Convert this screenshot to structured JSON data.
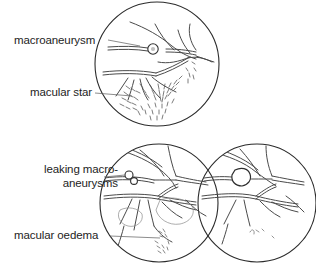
{
  "figure": {
    "background_color": "#ffffff",
    "ink_color": "#3a3a3a",
    "outline_color": "#2b2b2b"
  },
  "labels": [
    {
      "id": "macroaneurysm",
      "text": "macroaneurysm",
      "lines": [
        "macroaneurysm"
      ],
      "points_to": "top-panel-macroaneurysm"
    },
    {
      "id": "macular-star",
      "text": "macular star",
      "lines": [
        "macular star"
      ],
      "points_to": "top-panel-exudate-star"
    },
    {
      "id": "leaking-macroaneurysms",
      "text": "leaking macro-aneurysms",
      "lines": [
        "leaking macro-",
        "aneurysms"
      ],
      "points_to": "bottom-left-panel-aneurysm-cluster"
    },
    {
      "id": "macular-oedema",
      "text": "macular oedema",
      "lines": [
        "macular oedema"
      ],
      "points_to": "bottom-left-panel-oedema"
    }
  ],
  "panels": [
    {
      "id": "top-panel",
      "name": "fundus-top",
      "cx": 157,
      "cy": 64,
      "r": 62,
      "features": [
        "retinal-vessels",
        "macroaneurysm-circle",
        "macular-star-exudates"
      ]
    },
    {
      "id": "bottom-left-panel",
      "name": "fundus-bottom-left",
      "cx": 159,
      "cy": 203,
      "r": 59,
      "features": [
        "retinal-vessels",
        "leaking-aneurysm-cluster",
        "macular-oedema-area"
      ]
    },
    {
      "id": "bottom-right-panel",
      "name": "fundus-bottom-right",
      "cx": 257,
      "cy": 203,
      "r": 59,
      "features": [
        "retinal-vessels",
        "large-macroaneurysm-blob"
      ]
    }
  ]
}
